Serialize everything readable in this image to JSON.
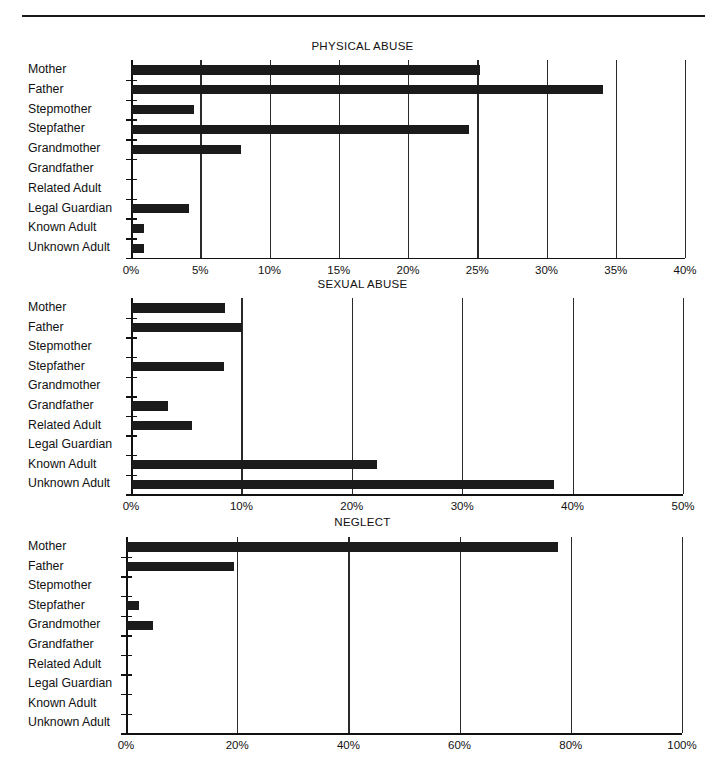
{
  "page": {
    "divider": "horizontal-rule"
  },
  "chart_data": [
    {
      "type": "bar",
      "orientation": "horizontal",
      "title": "PHYSICAL ABUSE",
      "xlabel": "",
      "ylabel": "",
      "xlim": [
        0,
        40
      ],
      "xticks": [
        "0%",
        "5%",
        "10%",
        "15%",
        "20%",
        "25%",
        "30%",
        "35%",
        "40%"
      ],
      "xtick_values": [
        0,
        5,
        10,
        15,
        20,
        25,
        30,
        35,
        40
      ],
      "grid": true,
      "legend": "none",
      "categories": [
        "Mother",
        "Father",
        "Stepmother",
        "Stepfather",
        "Grandmother",
        "Grandfather",
        "Related Adult",
        "Legal Guardian",
        "Known Adult",
        "Unknown Adult"
      ],
      "values": [
        25.1,
        34.0,
        4.5,
        24.3,
        7.9,
        0,
        0,
        4.1,
        0.9,
        0.9
      ]
    },
    {
      "type": "bar",
      "orientation": "horizontal",
      "title": "SEXUAL ABUSE",
      "xlabel": "",
      "ylabel": "",
      "xlim": [
        0,
        50
      ],
      "xticks": [
        "0%",
        "10%",
        "20%",
        "30%",
        "40%",
        "50%"
      ],
      "xtick_values": [
        0,
        10,
        20,
        30,
        40,
        50
      ],
      "grid": true,
      "legend": "none",
      "categories": [
        "Mother",
        "Father",
        "Stepmother",
        "Stepfather",
        "Grandmother",
        "Grandfather",
        "Related Adult",
        "Legal Guardian",
        "Known Adult",
        "Unknown Adult"
      ],
      "values": [
        8.4,
        10.0,
        0,
        8.3,
        0,
        3.3,
        5.4,
        0,
        22.2,
        38.2
      ]
    },
    {
      "type": "bar",
      "orientation": "horizontal",
      "title": "NEGLECT",
      "xlabel": "",
      "ylabel": "",
      "xlim": [
        0,
        100
      ],
      "xticks": [
        "0%",
        "20%",
        "40%",
        "60%",
        "80%",
        "100%"
      ],
      "xtick_values": [
        0,
        20,
        40,
        60,
        80,
        100
      ],
      "grid": true,
      "legend": "none",
      "categories": [
        "Mother",
        "Father",
        "Stepmother",
        "Stepfather",
        "Grandmother",
        "Grandfather",
        "Related Adult",
        "Legal Guardian",
        "Known Adult",
        "Unknown Adult"
      ],
      "values": [
        77.5,
        19.2,
        0,
        2.2,
        4.7,
        0,
        0,
        0,
        0,
        0
      ]
    }
  ],
  "colors": {
    "bar": "#1b1b1b",
    "axis": "#111111",
    "grid": "#2a2a2a",
    "background": "#ffffff"
  }
}
